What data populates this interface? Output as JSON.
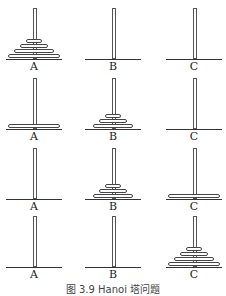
{
  "figure": {
    "caption": "图 3.9   Hanoi 塔问题",
    "peg_labels": [
      "A",
      "B",
      "C"
    ]
  },
  "stages": [
    {
      "A": 4,
      "B": 0,
      "C": 0,
      "disks": {
        "A": [
          1,
          2,
          3,
          4
        ],
        "B": [],
        "C": []
      }
    },
    {
      "A": 1,
      "B": 3,
      "C": 0,
      "disks": {
        "A": [
          4
        ],
        "B": [
          1,
          2,
          3
        ],
        "C": []
      }
    },
    {
      "A": 0,
      "B": 3,
      "C": 1,
      "disks": {
        "A": [],
        "B": [
          1,
          2,
          3
        ],
        "C": [
          4
        ]
      }
    },
    {
      "A": 0,
      "B": 0,
      "C": 4,
      "disks": {
        "A": [],
        "B": [],
        "C": [
          1,
          2,
          3,
          4
        ]
      }
    }
  ]
}
